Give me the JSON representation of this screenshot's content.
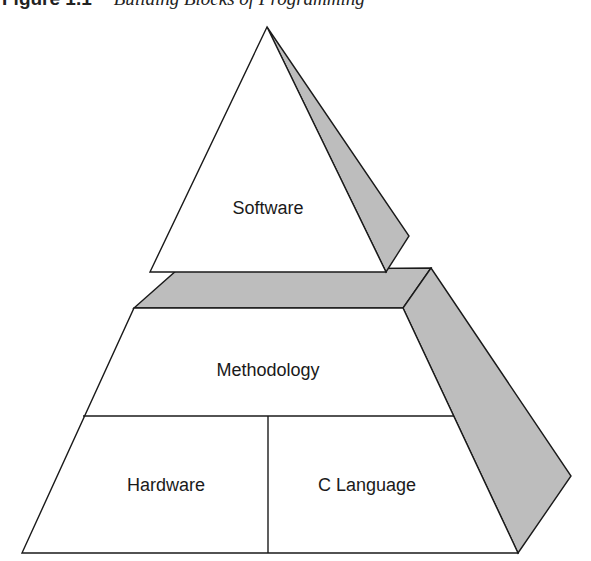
{
  "caption": {
    "figure_number": "Figure 1.1",
    "title": "Building Blocks of Programming"
  },
  "diagram": {
    "type": "pyramid",
    "colors": {
      "face": "#ffffff",
      "shade": "#bdbdbd",
      "stroke": "#1a1a1a"
    },
    "tiers": [
      {
        "id": "top",
        "label": "Software"
      },
      {
        "id": "middle",
        "label": "Methodology"
      },
      {
        "id": "base-left",
        "label": "Hardware"
      },
      {
        "id": "base-right",
        "label": "C Language"
      }
    ]
  }
}
